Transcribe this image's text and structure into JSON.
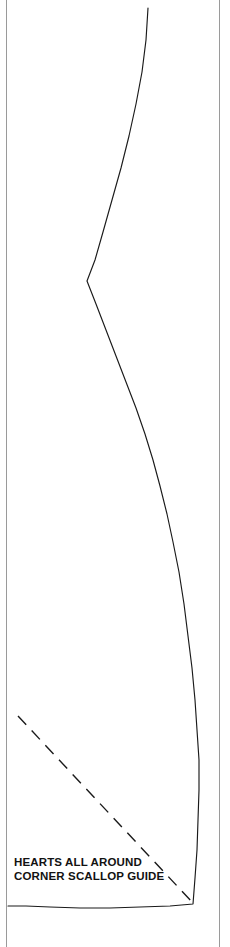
{
  "page": {
    "width": 230,
    "height": 947,
    "background_color": "#ffffff",
    "ink_color": "#1a1a1a",
    "border_color": "#9a9a9a",
    "document_type": "printed pattern template sheet"
  },
  "label": {
    "line1": "HEARTS ALL AROUND",
    "line2": "CORNER SCALLOP GUIDE",
    "x": 14,
    "y": 855,
    "font_size_px": 11.5,
    "weight": "bold",
    "color": "#121212"
  },
  "borders": {
    "left_rule": {
      "x": 6,
      "y1": 0,
      "y2": 947,
      "color": "#9a9a9a",
      "width": 1
    },
    "right_rule": {
      "x": 219,
      "y1": 0,
      "y2": 947,
      "color": "#9a9a9a",
      "width": 1
    }
  },
  "chart_data": {
    "type": "line",
    "title": "HEARTS ALL AROUND CORNER SCALLOP GUIDE",
    "xlabel": "",
    "ylabel": "",
    "xlim": [
      0,
      230
    ],
    "ylim": [
      0,
      947
    ],
    "grid": false,
    "legend": null,
    "series": [
      {
        "name": "scallop-cutting-curve",
        "style": "solid",
        "color": "#1a1a1a",
        "linewidth": 1.15,
        "description": "Continuous cutting line: descends from top edge, curves left to a sharp concave vertex, bows right to its widest point, then hooks back to the corner point and runs left along the bottom.",
        "points": [
          [
            148,
            8
          ],
          [
            146,
            40
          ],
          [
            142,
            72
          ],
          [
            136,
            104
          ],
          [
            129,
            136
          ],
          [
            121,
            168
          ],
          [
            112,
            200
          ],
          [
            103,
            232
          ],
          [
            95,
            260
          ],
          [
            87,
            281
          ],
          [
            96,
            304
          ],
          [
            106,
            330
          ],
          [
            116,
            356
          ],
          [
            126,
            382
          ],
          [
            136,
            408
          ],
          [
            145,
            434
          ],
          [
            153,
            460
          ],
          [
            160,
            486
          ],
          [
            167,
            514
          ],
          [
            173,
            542
          ],
          [
            179,
            572
          ],
          [
            184,
            604
          ],
          [
            188,
            636
          ],
          [
            192,
            668
          ],
          [
            195,
            700
          ],
          [
            197,
            730
          ],
          [
            199,
            760
          ],
          [
            199,
            790
          ],
          [
            198,
            820
          ],
          [
            197,
            850
          ],
          [
            195,
            878
          ],
          [
            193,
            904
          ],
          [
            170,
            906
          ],
          [
            140,
            907
          ],
          [
            110,
            908
          ],
          [
            80,
            908
          ],
          [
            50,
            907
          ],
          [
            26,
            906
          ],
          [
            8,
            906
          ]
        ]
      },
      {
        "name": "diagonal-placement-dashed-line",
        "style": "dashed",
        "color": "#1a1a1a",
        "linewidth": 1.4,
        "dash_pattern_px": [
          12,
          8
        ],
        "description": "Dashed 45-degree guide line from upper-left interior down to the scallop corner point.",
        "points": [
          [
            18,
            716
          ],
          [
            193,
            903
          ]
        ]
      }
    ],
    "annotations": [
      {
        "name": "guide-label",
        "text": "HEARTS ALL AROUND\nCORNER SCALLOP GUIDE",
        "x": 14,
        "y": 862,
        "bold": true
      }
    ],
    "reference_lines": [
      {
        "name": "left-page-rule",
        "orientation": "vertical",
        "x": 6,
        "color": "#9a9a9a"
      },
      {
        "name": "right-page-rule",
        "orientation": "vertical",
        "x": 219,
        "color": "#9a9a9a"
      }
    ]
  }
}
